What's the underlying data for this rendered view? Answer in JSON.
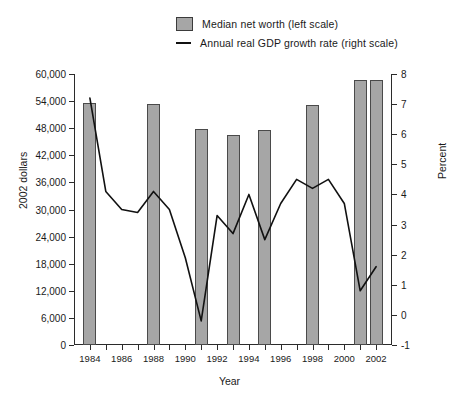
{
  "legend": {
    "items": [
      {
        "label": "Median net worth (left scale)",
        "marker": "bar-swatch-icon",
        "color": "#a6a6a6"
      },
      {
        "label": "Annual real GDP growth rate (right scale)",
        "marker": "line-swatch-icon",
        "color": "#111111"
      }
    ]
  },
  "axes": {
    "x_title": "Year",
    "y_left_title": "2002 dollars",
    "y_right_title": "Percent",
    "x_ticklabels": [
      "1984",
      "1986",
      "1988",
      "1990",
      "1992",
      "1994",
      "1996",
      "1998",
      "2000",
      "2002"
    ],
    "y_left_ticklabels": [
      "60,000",
      "54,000",
      "48,000",
      "42,000",
      "36,000",
      "30,000",
      "24,000",
      "18,000",
      "12,000",
      "6,000",
      "0"
    ],
    "y_right_ticklabels": [
      "8",
      "7",
      "6",
      "5",
      "4",
      "3",
      "2",
      "1",
      "0",
      "-1"
    ]
  },
  "chart_data": {
    "type": "bar",
    "title": "",
    "xlabel": "Year",
    "ylabel": "2002 dollars",
    "y2label": "Percent",
    "xlim": [
      1983,
      2003
    ],
    "ylim": [
      0,
      60000
    ],
    "y2lim": [
      -1,
      8
    ],
    "grid": false,
    "legend_position": "top-center",
    "series": [
      {
        "name": "Median net worth (left scale)",
        "type": "bar",
        "axis": "left",
        "color": "#a6a6a6",
        "x": [
          1984,
          1988,
          1991,
          1993,
          1995,
          1998,
          2001,
          2002
        ],
        "values": [
          53500,
          53400,
          47800,
          46600,
          47600,
          53200,
          58700,
          58600
        ]
      },
      {
        "name": "Annual real GDP growth rate (right scale)",
        "type": "line",
        "axis": "right",
        "color": "#111111",
        "x": [
          1984,
          1985,
          1986,
          1987,
          1988,
          1989,
          1990,
          1991,
          1992,
          1993,
          1994,
          1995,
          1996,
          1997,
          1998,
          1999,
          2000,
          2001,
          2002
        ],
        "values": [
          7.2,
          4.1,
          3.5,
          3.4,
          4.1,
          3.5,
          1.9,
          -0.2,
          3.3,
          2.7,
          4.0,
          2.5,
          3.7,
          4.5,
          4.2,
          4.5,
          3.7,
          0.8,
          1.6
        ]
      }
    ]
  }
}
